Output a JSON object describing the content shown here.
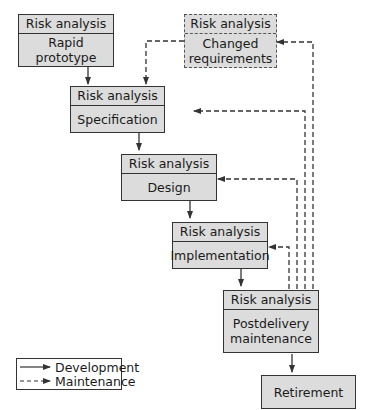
{
  "diagram": {
    "nodes": [
      {
        "id": "rapid-prototype",
        "header": "Risk analysis",
        "label": "Rapid\nprototype",
        "style": "solid"
      },
      {
        "id": "changed-requirements",
        "header": "Risk analysis",
        "label": "Changed\nrequirements",
        "style": "dashed"
      },
      {
        "id": "specification",
        "header": "Risk analysis",
        "label": "Specification",
        "style": "solid"
      },
      {
        "id": "design",
        "header": "Risk analysis",
        "label": "Design",
        "style": "solid"
      },
      {
        "id": "implementation",
        "header": "Risk analysis",
        "label": "Implementation",
        "style": "solid"
      },
      {
        "id": "postdelivery-maintenance",
        "header": "Risk analysis",
        "label": "Postdelivery\nmaintenance",
        "style": "solid"
      },
      {
        "id": "retirement",
        "label": "Retirement",
        "style": "solid"
      }
    ],
    "edges": [
      {
        "from": "rapid-prototype",
        "to": "specification",
        "type": "development"
      },
      {
        "from": "specification",
        "to": "design",
        "type": "development"
      },
      {
        "from": "design",
        "to": "implementation",
        "type": "development"
      },
      {
        "from": "implementation",
        "to": "postdelivery-maintenance",
        "type": "development"
      },
      {
        "from": "postdelivery-maintenance",
        "to": "retirement",
        "type": "development"
      },
      {
        "from": "changed-requirements",
        "to": "specification",
        "type": "maintenance"
      },
      {
        "from": "postdelivery-maintenance",
        "to": "changed-requirements",
        "type": "maintenance"
      },
      {
        "from": "postdelivery-maintenance",
        "to": "specification",
        "type": "maintenance"
      },
      {
        "from": "postdelivery-maintenance",
        "to": "design",
        "type": "maintenance"
      },
      {
        "from": "postdelivery-maintenance",
        "to": "implementation",
        "type": "maintenance"
      }
    ],
    "legend": [
      {
        "label": "Development",
        "style": "solid"
      },
      {
        "label": "Maintenance",
        "style": "dashed"
      }
    ]
  }
}
